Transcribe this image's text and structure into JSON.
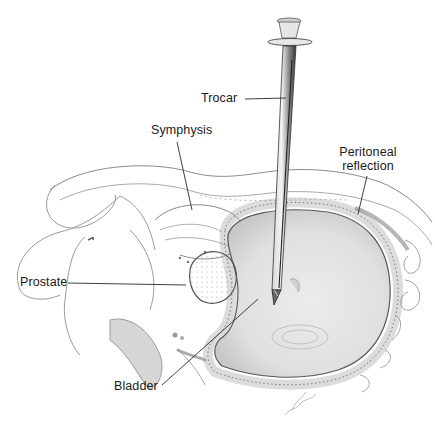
{
  "figure": {
    "type": "anatomical-illustration",
    "colors": {
      "background": "#ffffff",
      "line": "#6e6e6e",
      "label_line": "#2a2a2a",
      "bladder_fill": "#dcdcdc",
      "bladder_wall": "#8a8a8a",
      "trocar_fill": "#b8b8b8",
      "text": "#1a1a1a"
    }
  },
  "labels": {
    "trocar": "Trocar",
    "symphysis": "Symphysis",
    "peritoneal_line1": "Peritoneal",
    "peritoneal_line2": "reflection",
    "prostate": "Prostate",
    "bladder": "Bladder"
  }
}
